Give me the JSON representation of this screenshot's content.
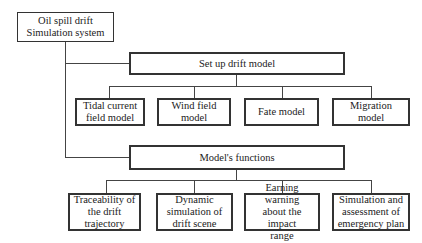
{
  "diagram": {
    "root": {
      "label": "Oil spill drift\nSimulation system"
    },
    "branches": [
      {
        "label": "Set up drift model",
        "children": [
          {
            "label": "Tidal current\nfield model"
          },
          {
            "label": "Wind field model"
          },
          {
            "label": "Fate model"
          },
          {
            "label": "Migration model"
          }
        ]
      },
      {
        "label": "Model's functions",
        "children": [
          {
            "label": "Traceability of\nthe drift\ntrajectory"
          },
          {
            "label": "Dynamic\nsimulation of\ndrift scene"
          },
          {
            "label": "Earning warning\nabout the impact\nrange"
          },
          {
            "label": "Simulation and\nassessment of\nemergency plan"
          }
        ]
      }
    ],
    "colors": {
      "stroke": "#333333",
      "background": "#ffffff",
      "text": "#222222"
    }
  }
}
